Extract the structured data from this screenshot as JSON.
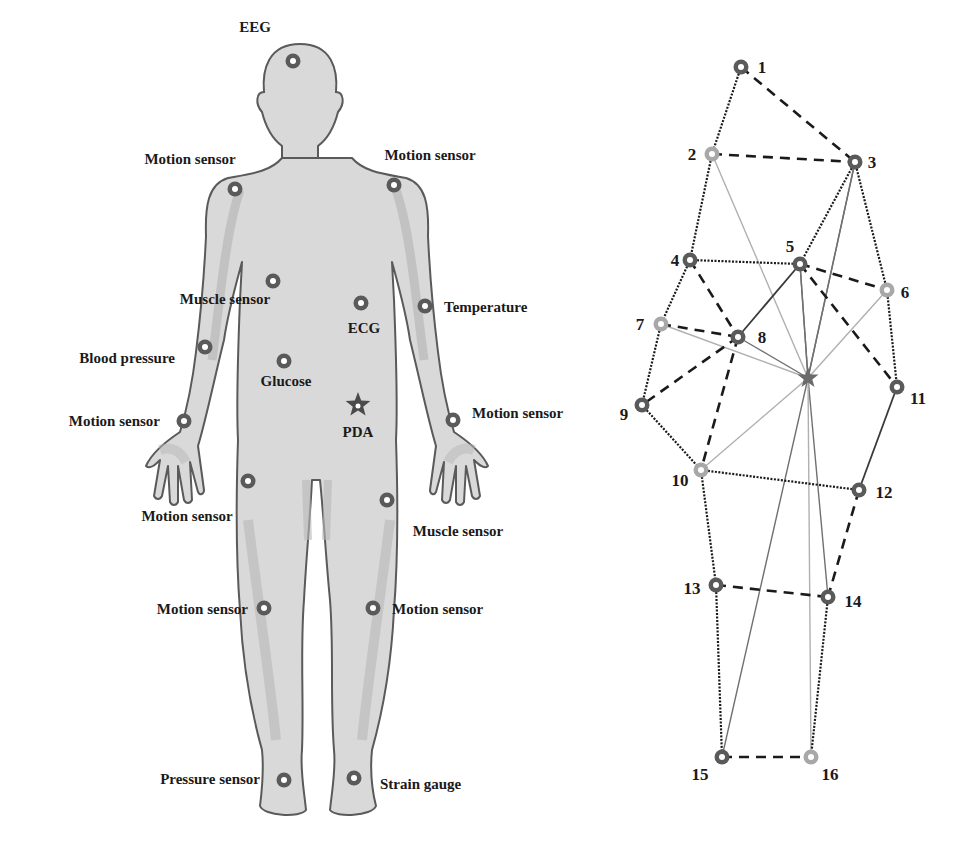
{
  "colors": {
    "background": "#ffffff",
    "body_fill": "#d9d9d9",
    "body_shade": "#b8b8b8",
    "body_outline": "#5a5a5a",
    "sensor_ring": "#5a5a5a",
    "sensor_ring_light": "#a8a8a8",
    "text": "#1a1a1a",
    "edge_dark": "#1a1a1a",
    "edge_mid": "#707070",
    "edge_light": "#b0b0b0"
  },
  "body_diagram": {
    "sensors": [
      {
        "id": "eeg",
        "label": "EEG",
        "x": 293,
        "y": 61,
        "lx": 255,
        "ly": 32,
        "anchor": "middle"
      },
      {
        "id": "motion-shoulder-left",
        "label": "Motion sensor",
        "x": 235,
        "y": 189,
        "lx": 190,
        "ly": 164,
        "anchor": "middle"
      },
      {
        "id": "motion-shoulder-right",
        "label": "Motion sensor",
        "x": 394,
        "y": 185,
        "lx": 430,
        "ly": 160,
        "anchor": "middle"
      },
      {
        "id": "muscle-chest",
        "label": "Muscle sensor",
        "x": 273,
        "y": 281,
        "lx": 225,
        "ly": 304,
        "anchor": "middle"
      },
      {
        "id": "ecg",
        "label": "ECG",
        "x": 361,
        "y": 303,
        "lx": 364,
        "ly": 333,
        "anchor": "middle"
      },
      {
        "id": "temperature",
        "label": "Temperature",
        "x": 425,
        "y": 306,
        "lx": 444,
        "ly": 312,
        "anchor": "start"
      },
      {
        "id": "blood-pressure",
        "label": "Blood pressure",
        "x": 205,
        "y": 347,
        "lx": 175,
        "ly": 363,
        "anchor": "end"
      },
      {
        "id": "glucose",
        "label": "Glucose",
        "x": 284,
        "y": 361,
        "lx": 286,
        "ly": 386,
        "anchor": "middle"
      },
      {
        "id": "motion-wrist-left",
        "label": "Motion sensor",
        "x": 184,
        "y": 421,
        "lx": 160,
        "ly": 426,
        "anchor": "end"
      },
      {
        "id": "motion-wrist-right",
        "label": "Motion sensor",
        "x": 453,
        "y": 420,
        "lx": 472,
        "ly": 418,
        "anchor": "start"
      },
      {
        "id": "motion-thigh-left",
        "label": "Motion sensor",
        "x": 248,
        "y": 481,
        "lx": 187,
        "ly": 521,
        "anchor": "middle"
      },
      {
        "id": "muscle-thigh-right",
        "label": "Muscle sensor",
        "x": 387,
        "y": 500,
        "lx": 458,
        "ly": 536,
        "anchor": "middle"
      },
      {
        "id": "motion-knee-left",
        "label": "Motion sensor",
        "x": 264,
        "y": 608,
        "lx": 248,
        "ly": 614,
        "anchor": "end"
      },
      {
        "id": "motion-knee-right",
        "label": "Motion sensor",
        "x": 373,
        "y": 608,
        "lx": 392,
        "ly": 614,
        "anchor": "start"
      },
      {
        "id": "pressure-foot",
        "label": "Pressure sensor",
        "x": 284,
        "y": 780,
        "lx": 260,
        "ly": 784,
        "anchor": "end"
      },
      {
        "id": "strain-gauge",
        "label": "Strain gauge",
        "x": 354,
        "y": 778,
        "lx": 380,
        "ly": 789,
        "anchor": "start"
      }
    ],
    "hub": {
      "id": "pda",
      "label": "PDA",
      "x": 358,
      "y": 405,
      "lx": 358,
      "ly": 437
    }
  },
  "network_graph": {
    "hub": {
      "label": "",
      "x": 808,
      "y": 378
    },
    "nodes": [
      {
        "id": 1,
        "label": "1",
        "x": 741,
        "y": 67,
        "shade": "dark",
        "lx": 762,
        "ly": 73
      },
      {
        "id": 2,
        "label": "2",
        "x": 712,
        "y": 154,
        "shade": "light",
        "lx": 692,
        "ly": 160
      },
      {
        "id": 3,
        "label": "3",
        "x": 855,
        "y": 162,
        "shade": "dark",
        "lx": 872,
        "ly": 168
      },
      {
        "id": 4,
        "label": "4",
        "x": 690,
        "y": 260,
        "shade": "dark",
        "lx": 675,
        "ly": 266
      },
      {
        "id": 5,
        "label": "5",
        "x": 800,
        "y": 264,
        "shade": "dark",
        "lx": 790,
        "ly": 252
      },
      {
        "id": 6,
        "label": "6",
        "x": 887,
        "y": 290,
        "shade": "light",
        "lx": 905,
        "ly": 298
      },
      {
        "id": 7,
        "label": "7",
        "x": 661,
        "y": 324,
        "shade": "light",
        "lx": 640,
        "ly": 330
      },
      {
        "id": 8,
        "label": "8",
        "x": 738,
        "y": 337,
        "shade": "dark",
        "lx": 762,
        "ly": 343
      },
      {
        "id": 9,
        "label": "9",
        "x": 642,
        "y": 405,
        "shade": "dark",
        "lx": 624,
        "ly": 420
      },
      {
        "id": 10,
        "label": "10",
        "x": 701,
        "y": 470,
        "shade": "light",
        "lx": 680,
        "ly": 486
      },
      {
        "id": 11,
        "label": "11",
        "x": 897,
        "y": 387,
        "shade": "dark",
        "lx": 918,
        "ly": 404
      },
      {
        "id": 12,
        "label": "12",
        "x": 859,
        "y": 490,
        "shade": "dark",
        "lx": 884,
        "ly": 498
      },
      {
        "id": 13,
        "label": "13",
        "x": 716,
        "y": 585,
        "shade": "dark",
        "lx": 692,
        "ly": 594
      },
      {
        "id": 14,
        "label": "14",
        "x": 828,
        "y": 597,
        "shade": "dark",
        "lx": 853,
        "ly": 607
      },
      {
        "id": 15,
        "label": "15",
        "x": 722,
        "y": 757,
        "shade": "dark",
        "lx": 700,
        "ly": 780
      },
      {
        "id": 16,
        "label": "16",
        "x": 811,
        "y": 757,
        "shade": "light",
        "lx": 830,
        "ly": 780
      }
    ],
    "edges": [
      {
        "from": 1,
        "to": 3,
        "style": "dashed"
      },
      {
        "from": 1,
        "to": 2,
        "style": "dotted"
      },
      {
        "from": 2,
        "to": 3,
        "style": "dashed"
      },
      {
        "from": 2,
        "to": 4,
        "style": "dotted"
      },
      {
        "from": 3,
        "to": 5,
        "style": "dotted"
      },
      {
        "from": 3,
        "to": 6,
        "style": "dotted"
      },
      {
        "from": 4,
        "to": 5,
        "style": "dotted"
      },
      {
        "from": 4,
        "to": 8,
        "style": "dashed"
      },
      {
        "from": 4,
        "to": 7,
        "style": "dotted"
      },
      {
        "from": 5,
        "to": 6,
        "style": "dashed"
      },
      {
        "from": 5,
        "to": 8,
        "style": "solid-dark"
      },
      {
        "from": 5,
        "to": 11,
        "style": "dashed"
      },
      {
        "from": 6,
        "to": 11,
        "style": "dotted"
      },
      {
        "from": 7,
        "to": 8,
        "style": "dashed"
      },
      {
        "from": 7,
        "to": 9,
        "style": "dotted"
      },
      {
        "from": 8,
        "to": 9,
        "style": "dashed"
      },
      {
        "from": 8,
        "to": 10,
        "style": "dashed"
      },
      {
        "from": 9,
        "to": 10,
        "style": "dotted"
      },
      {
        "from": 10,
        "to": 12,
        "style": "dotted"
      },
      {
        "from": 10,
        "to": 13,
        "style": "dotted"
      },
      {
        "from": 11,
        "to": 12,
        "style": "solid-dark"
      },
      {
        "from": 12,
        "to": 14,
        "style": "dashed"
      },
      {
        "from": 13,
        "to": 14,
        "style": "dashed"
      },
      {
        "from": 13,
        "to": 15,
        "style": "dotted"
      },
      {
        "from": 14,
        "to": 16,
        "style": "dotted"
      },
      {
        "from": 15,
        "to": 16,
        "style": "dashed"
      }
    ],
    "hub_links": [
      {
        "node": 2,
        "shade": "light"
      },
      {
        "node": 3,
        "shade": "mid"
      },
      {
        "node": 3,
        "shade": "mid",
        "note": "second ray to 3 shown"
      },
      {
        "node": 5,
        "shade": "mid"
      },
      {
        "node": 6,
        "shade": "light"
      },
      {
        "node": 7,
        "shade": "light"
      },
      {
        "node": 8,
        "shade": "mid"
      },
      {
        "node": 10,
        "shade": "light"
      },
      {
        "node": 14,
        "shade": "mid"
      },
      {
        "node": 15,
        "shade": "mid"
      },
      {
        "node": 16,
        "shade": "light"
      }
    ]
  }
}
